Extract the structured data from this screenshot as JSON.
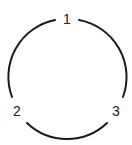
{
  "diagram": {
    "type": "cycle-graph",
    "nodes": [
      {
        "id": "1",
        "label": "1"
      },
      {
        "id": "2",
        "label": "2"
      },
      {
        "id": "3",
        "label": "3"
      }
    ],
    "edges": [
      {
        "from": "1",
        "to": "2"
      },
      {
        "from": "2",
        "to": "3"
      },
      {
        "from": "3",
        "to": "1"
      }
    ],
    "colors": {
      "stroke": "#1a1a1a",
      "text": "#222222",
      "background": "#ffffff"
    }
  }
}
